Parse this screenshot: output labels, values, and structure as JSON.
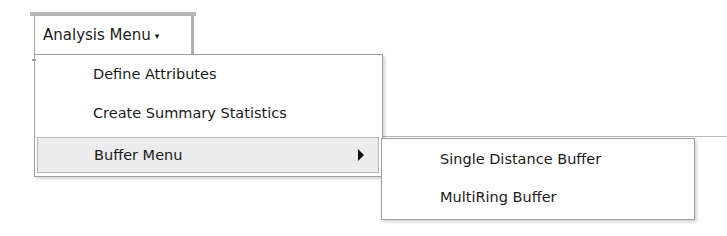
{
  "menu_button": {
    "label": "Analysis Menu",
    "caret": "▾"
  },
  "dropdown": {
    "items": [
      {
        "label": "Define Attributes",
        "has_submenu": false
      },
      {
        "label": "Create Summary Statistics",
        "has_submenu": false
      },
      {
        "label": "Buffer Menu",
        "has_submenu": true,
        "highlighted": true
      }
    ]
  },
  "submenu": {
    "items": [
      {
        "label": "Single Distance Buffer"
      },
      {
        "label": "MultiRing Buffer"
      }
    ]
  },
  "colors": {
    "highlight_bg": "#ececec",
    "border": "#a0a0a0"
  }
}
